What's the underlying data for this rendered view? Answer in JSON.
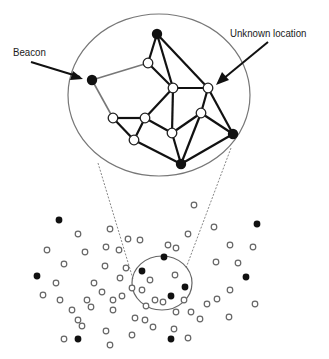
{
  "labels": {
    "beacon": "Beacon",
    "unknown_location": "Unknown location"
  },
  "colors": {
    "ink": "#111111",
    "gray_edge": "#777777",
    "open_fill": "#ffffff"
  },
  "zoom_circle": {
    "cx": 159,
    "cy": 95,
    "rx": 91,
    "ry": 81
  },
  "source_circle": {
    "cx": 162,
    "cy": 283,
    "rx": 30,
    "ry": 27
  },
  "network": {
    "nodes": [
      {
        "id": "b1",
        "x": 92,
        "y": 80,
        "type": "beacon"
      },
      {
        "id": "b2",
        "x": 157,
        "y": 34,
        "type": "beacon"
      },
      {
        "id": "b3",
        "x": 233,
        "y": 134,
        "type": "beacon"
      },
      {
        "id": "b4",
        "x": 181,
        "y": 164,
        "type": "beacon"
      },
      {
        "id": "u1",
        "x": 148,
        "y": 63,
        "type": "unknown"
      },
      {
        "id": "u2",
        "x": 173,
        "y": 88,
        "type": "unknown"
      },
      {
        "id": "u3",
        "x": 208,
        "y": 88,
        "type": "unknown"
      },
      {
        "id": "u4",
        "x": 113,
        "y": 118,
        "type": "unknown"
      },
      {
        "id": "u5",
        "x": 145,
        "y": 118,
        "type": "unknown"
      },
      {
        "id": "u6",
        "x": 201,
        "y": 113,
        "type": "unknown"
      },
      {
        "id": "u7",
        "x": 172,
        "y": 133,
        "type": "unknown"
      },
      {
        "id": "u8",
        "x": 134,
        "y": 140,
        "type": "unknown"
      }
    ],
    "edges": [
      [
        "b1",
        "u1",
        "gray"
      ],
      [
        "b1",
        "u4",
        "gray"
      ],
      [
        "b2",
        "u1",
        "dark"
      ],
      [
        "b2",
        "u2",
        "dark"
      ],
      [
        "b2",
        "u3",
        "dark"
      ],
      [
        "u1",
        "u2",
        "dark"
      ],
      [
        "u2",
        "u3",
        "dark"
      ],
      [
        "u2",
        "u5",
        "dark"
      ],
      [
        "u2",
        "u7",
        "dark"
      ],
      [
        "u3",
        "u6",
        "dark"
      ],
      [
        "u3",
        "b3",
        "dark"
      ],
      [
        "u4",
        "u5",
        "dark"
      ],
      [
        "u4",
        "u8",
        "dark"
      ],
      [
        "u5",
        "u8",
        "dark"
      ],
      [
        "u5",
        "u7",
        "dark"
      ],
      [
        "u7",
        "u6",
        "dark"
      ],
      [
        "u6",
        "b3",
        "dark"
      ],
      [
        "u6",
        "b4",
        "dark"
      ],
      [
        "u7",
        "b4",
        "dark"
      ],
      [
        "u8",
        "b4",
        "dark"
      ],
      [
        "b3",
        "b4",
        "dark"
      ]
    ]
  },
  "scatter": {
    "beacons": [
      [
        59,
        220
      ],
      [
        257,
        224
      ],
      [
        37,
        276
      ],
      [
        164,
        257
      ],
      [
        142,
        271
      ],
      [
        185,
        287
      ],
      [
        171,
        296
      ],
      [
        246,
        277
      ],
      [
        78,
        339
      ],
      [
        171,
        339
      ]
    ],
    "unknowns": [
      [
        194,
        205
      ],
      [
        78,
        234
      ],
      [
        110,
        229
      ],
      [
        128,
        239
      ],
      [
        47,
        250
      ],
      [
        85,
        252
      ],
      [
        106,
        247
      ],
      [
        119,
        250
      ],
      [
        140,
        240
      ],
      [
        188,
        234
      ],
      [
        176,
        248
      ],
      [
        214,
        227
      ],
      [
        230,
        245
      ],
      [
        253,
        247
      ],
      [
        168,
        245
      ],
      [
        64,
        264
      ],
      [
        105,
        266
      ],
      [
        126,
        268
      ],
      [
        94,
        283
      ],
      [
        120,
        278
      ],
      [
        102,
        292
      ],
      [
        56,
        283
      ],
      [
        43,
        295
      ],
      [
        132,
        288
      ],
      [
        142,
        290
      ],
      [
        150,
        280
      ],
      [
        175,
        275
      ],
      [
        155,
        300
      ],
      [
        216,
        262
      ],
      [
        238,
        263
      ],
      [
        72,
        310
      ],
      [
        91,
        307
      ],
      [
        78,
        320
      ],
      [
        113,
        310
      ],
      [
        146,
        306
      ],
      [
        163,
        302
      ],
      [
        191,
        312
      ],
      [
        207,
        304
      ],
      [
        135,
        318
      ],
      [
        230,
        290
      ],
      [
        217,
        299
      ],
      [
        200,
        319
      ],
      [
        229,
        317
      ],
      [
        176,
        312
      ],
      [
        106,
        331
      ],
      [
        132,
        335
      ],
      [
        153,
        327
      ],
      [
        174,
        329
      ],
      [
        188,
        338
      ],
      [
        122,
        296
      ],
      [
        113,
        300
      ],
      [
        87,
        300
      ],
      [
        82,
        326
      ],
      [
        255,
        304
      ],
      [
        184,
        300
      ],
      [
        145,
        320
      ],
      [
        60,
        300
      ],
      [
        64,
        339
      ],
      [
        110,
        345
      ]
    ]
  }
}
